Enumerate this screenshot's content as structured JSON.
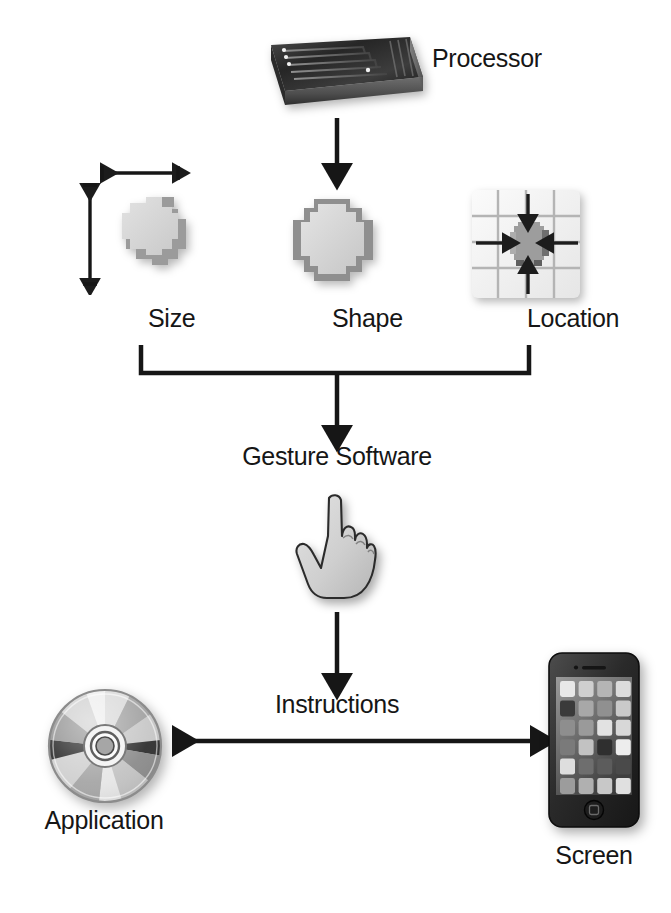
{
  "diagram": {
    "type": "flowchart",
    "background_color": "#ffffff",
    "stroke_color": "#161616",
    "nodes": {
      "processor": {
        "label": "Processor",
        "icon": "processor-chip-icon",
        "description": "3D integrated circuit chip with circuit traces"
      },
      "size": {
        "label": "Size",
        "icon": "size-blob-icon",
        "description": "Pixelated touch blob with width and height dimension arrows"
      },
      "shape": {
        "label": "Shape",
        "icon": "shape-blob-icon",
        "description": "Pixelated touch blob outline"
      },
      "location": {
        "label": "Location",
        "icon": "location-grid-icon",
        "description": "Grid with centered blob and four inward arrows"
      },
      "gesture_software": {
        "label": "Gesture Software",
        "icon": "pointing-hand-icon",
        "description": "Hand with index finger extended upward"
      },
      "instructions": {
        "label": "Instructions",
        "icon": "bidirectional-arrow-icon"
      },
      "application": {
        "label": "Application",
        "icon": "compact-disc-icon",
        "description": "Optical disc with radial reflective segments"
      },
      "screen": {
        "label": "Screen",
        "icon": "smartphone-icon",
        "description": "Smartphone displaying a grid of app tiles"
      }
    },
    "edges": [
      {
        "from": "processor",
        "to": "attributes-row",
        "style": "arrow-down"
      },
      {
        "from": "size",
        "to": "merge-bar",
        "style": "line"
      },
      {
        "from": "shape",
        "to": "merge-bar",
        "style": "line"
      },
      {
        "from": "location",
        "to": "merge-bar",
        "style": "line"
      },
      {
        "from": "merge-bar",
        "to": "gesture_software",
        "style": "arrow-down"
      },
      {
        "from": "gesture_software",
        "to": "instructions",
        "style": "arrow-down"
      },
      {
        "from": "application",
        "to": "screen",
        "style": "arrow-bidirectional"
      }
    ],
    "phone_screen_tiles": [
      [
        "#e8e8e8",
        "#cfcfcf",
        "#b5b5b5",
        "#dcdcdc"
      ],
      [
        "#3a3a3a",
        "#a8a8a8",
        "#909090",
        "#cacaca"
      ],
      [
        "#8e8e8e",
        "#9a9a9a",
        "#e2e2e2",
        "#d8d8d8"
      ],
      [
        "#7a7a7a",
        "#c2c2c2",
        "#2f2f2f",
        "#ededed"
      ],
      [
        "#dedede",
        "#6e6e6e",
        "#5c5c5c",
        "#4a4a4a"
      ],
      [
        "#9c9c9c",
        "#b0b0b0",
        "#c8c8c8",
        "#e0e0e0"
      ]
    ]
  }
}
